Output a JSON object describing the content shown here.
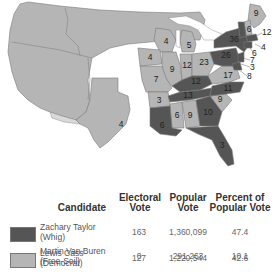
{
  "colors": {
    "whig": "#555555",
    "democrat": "#b5b5b5",
    "territory": "#b5b5b5",
    "unorganized_light": "#d9d9d9",
    "border": "#7a7a7a",
    "water": "#ffffff"
  },
  "map": {
    "state_labels": [
      {
        "id": "oregon_terr",
        "label": ""
      },
      {
        "id": "texas",
        "label": "4"
      },
      {
        "id": "wisconsin",
        "label": "4"
      },
      {
        "id": "iowa",
        "label": "4"
      },
      {
        "id": "michigan",
        "label": "5"
      },
      {
        "id": "illinois",
        "label": "9"
      },
      {
        "id": "indiana",
        "label": "12"
      },
      {
        "id": "ohio",
        "label": "23"
      },
      {
        "id": "missouri",
        "label": "7"
      },
      {
        "id": "kentucky",
        "label": "12"
      },
      {
        "id": "virginia",
        "label": "17"
      },
      {
        "id": "tennessee",
        "label": "13"
      },
      {
        "id": "north_carolina",
        "label": "11"
      },
      {
        "id": "arkansas",
        "label": "3"
      },
      {
        "id": "mississippi",
        "label": "6"
      },
      {
        "id": "alabama",
        "label": "9"
      },
      {
        "id": "georgia",
        "label": "10"
      },
      {
        "id": "south_carolina",
        "label": "9"
      },
      {
        "id": "louisiana",
        "label": "6"
      },
      {
        "id": "florida",
        "label": "3"
      },
      {
        "id": "new_york",
        "label": "36"
      },
      {
        "id": "pennsylvania",
        "label": "26"
      },
      {
        "id": "maine",
        "label": "9"
      },
      {
        "id": "new_hampshire",
        "label": "6"
      },
      {
        "id": "vermont",
        "label": "6"
      }
    ],
    "callouts": [
      {
        "id": "massachusetts",
        "label": "12"
      },
      {
        "id": "rhode_island",
        "label": "4"
      },
      {
        "id": "connecticut",
        "label": "6"
      },
      {
        "id": "new_jersey",
        "label": "7"
      },
      {
        "id": "delaware",
        "label": "3"
      },
      {
        "id": "maryland",
        "label": "8"
      }
    ]
  },
  "table": {
    "headers": {
      "candidate": "Candidate",
      "electoral": [
        "Electoral",
        "Vote"
      ],
      "popular": [
        "Popular",
        "Vote"
      ],
      "percent": [
        "Percent of",
        "Popular Vote"
      ]
    },
    "rows": [
      {
        "name": "Zachary Taylor",
        "party": "(Whig)",
        "electoral": "163",
        "popular": "1,360,099",
        "percent": "47.4",
        "swatch": "#555555"
      },
      {
        "name": "Lewis Cass",
        "party": "(Democrat)",
        "electoral": "127",
        "popular": "1,220,544",
        "percent": "42.6",
        "swatch": "#b5b5b5"
      },
      {
        "name": "Martin Van Buren",
        "party": "(Free-Soil)",
        "electoral": "0",
        "popular": "291,263",
        "percent": "10.1",
        "swatch": ""
      }
    ]
  }
}
